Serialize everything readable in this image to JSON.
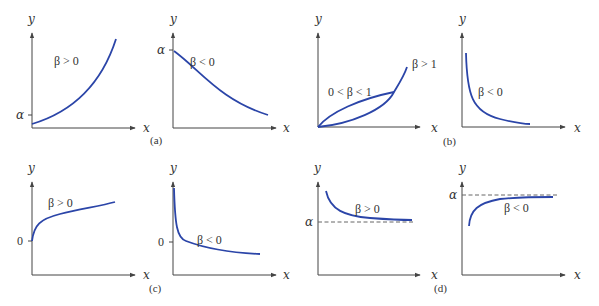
{
  "figure": {
    "colors": {
      "curve": "#2b45a8",
      "axis": "#444444",
      "dashed": "#666666",
      "text": "#333333"
    },
    "axis_labels": {
      "x": "x",
      "y": "y"
    },
    "panels": [
      {
        "id": "a",
        "caption": "(a)",
        "plots": [
          {
            "tick_label": "α",
            "curve_label": "β > 0",
            "shape": "exponential increasing from α"
          },
          {
            "tick_label": "α",
            "curve_label": "β < 0",
            "shape": "exponential decay from α"
          }
        ]
      },
      {
        "id": "b",
        "caption": "(b)",
        "plots": [
          {
            "curve_labels": [
              "0 < β < 1",
              "β > 1"
            ],
            "shape": "power functions through origin"
          },
          {
            "curve_label": "β < 0",
            "shape": "power decay, hyperbolic"
          }
        ]
      },
      {
        "id": "c",
        "caption": "(c)",
        "plots": [
          {
            "tick_label": "0",
            "curve_label": "β > 0",
            "shape": "logarithmic increasing"
          },
          {
            "tick_label": "0",
            "curve_label": "β < 0",
            "shape": "logarithmic decreasing"
          }
        ]
      },
      {
        "id": "d",
        "caption": "(d)",
        "plots": [
          {
            "tick_label": "α",
            "curve_label": "β > 0",
            "shape": "decreasing to asymptote α"
          },
          {
            "tick_label": "α",
            "curve_label": "β < 0",
            "shape": "increasing to asymptote α"
          }
        ]
      }
    ]
  }
}
